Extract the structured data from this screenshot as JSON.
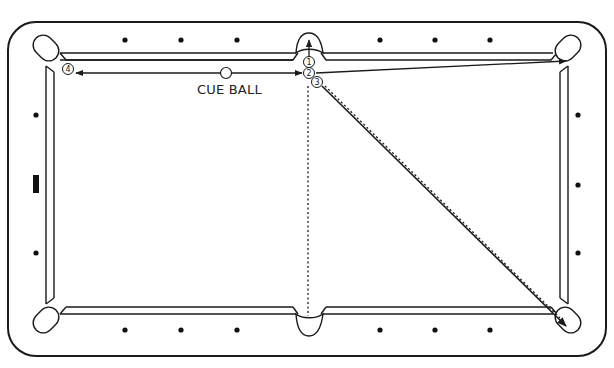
{
  "diagram": {
    "cue_ball_label": "CUE BALL",
    "ball_markers": [
      {
        "id": "1",
        "label": "1"
      },
      {
        "id": "2",
        "label": "2"
      },
      {
        "id": "3",
        "label": "3"
      },
      {
        "id": "4",
        "label": "4"
      }
    ],
    "colors": {
      "line": "#1a1a1a",
      "background": "#ffffff",
      "diamond": "#111111"
    }
  }
}
